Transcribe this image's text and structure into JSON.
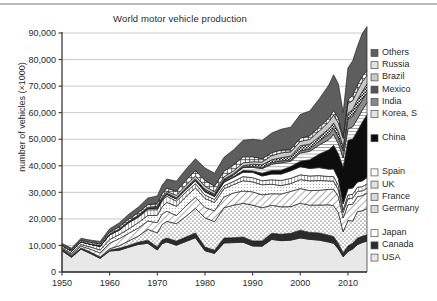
{
  "chart_data": {
    "type": "area",
    "title": "World motor vehicle production",
    "xlabel": "",
    "ylabel": "number of vehicles (×1000)",
    "xlim": [
      1950,
      2014
    ],
    "ylim": [
      0,
      90000
    ],
    "xticks": [
      "1950",
      "1960",
      "1970",
      "1980",
      "1990",
      "2000",
      "2010"
    ],
    "xtick_values": [
      1950,
      1960,
      1970,
      1980,
      1990,
      2000,
      2010
    ],
    "yticks": [
      "0",
      "10,000",
      "20,000",
      "30,000",
      "40,000",
      "50,000",
      "60,000",
      "70,000",
      "80,000",
      "90,000"
    ],
    "ytick_values": [
      0,
      10000,
      20000,
      30000,
      40000,
      50000,
      60000,
      70000,
      80000,
      90000
    ],
    "grid": true,
    "legend_position": "right",
    "stacked": true,
    "x": [
      1950,
      1952,
      1954,
      1956,
      1958,
      1960,
      1962,
      1964,
      1966,
      1968,
      1970,
      1971,
      1972,
      1974,
      1976,
      1978,
      1980,
      1982,
      1984,
      1986,
      1988,
      1990,
      1992,
      1994,
      1996,
      1998,
      2000,
      2002,
      2004,
      2006,
      2007,
      2008,
      2009,
      2010,
      2011,
      2012,
      2013,
      2014
    ],
    "series": [
      {
        "name": "USA",
        "pattern": "solid-lightest",
        "color": "#e8e8e8",
        "values": [
          8006,
          5539,
          8611,
          6920,
          5126,
          7905,
          8189,
          9308,
          10358,
          10820,
          8284,
          10672,
          11314,
          10071,
          11498,
          12887,
          8010,
          6985,
          10939,
          11063,
          11214,
          9783,
          9729,
          12263,
          11799,
          12003,
          12800,
          12280,
          11990,
          11264,
          10781,
          8694,
          5709,
          7743,
          8662,
          10336,
          11066,
          11660
        ]
      },
      {
        "name": "Canada",
        "pattern": "solid-dark",
        "color": "#2b2b2b",
        "values": [
          390,
          510,
          366,
          472,
          353,
          398,
          708,
          671,
          863,
          1175,
          1160,
          1372,
          1471,
          1560,
          1646,
          1818,
          1374,
          1236,
          1835,
          1854,
          1976,
          1928,
          1961,
          2321,
          2397,
          2568,
          2962,
          2629,
          2712,
          2572,
          2578,
          2082,
          1490,
          2068,
          2135,
          2463,
          2380,
          2394
        ]
      },
      {
        "name": "Japan",
        "pattern": "dots",
        "color": "#ffffff",
        "values": [
          32,
          39,
          70,
          111,
          188,
          482,
          991,
          1702,
          2286,
          4086,
          5289,
          5810,
          6294,
          6552,
          7841,
          9269,
          11043,
          10732,
          11465,
          12260,
          12700,
          13487,
          12499,
          10554,
          10346,
          10050,
          10141,
          10257,
          10512,
          11484,
          11596,
          11576,
          7934,
          9629,
          8399,
          9943,
          9630,
          9775
        ]
      },
      {
        "name": "Germany",
        "pattern": "diagonal",
        "color": "#ffffff",
        "values": [
          306,
          441,
          684,
          1075,
          1495,
          2055,
          2668,
          2911,
          3050,
          3103,
          3842,
          3986,
          3816,
          3097,
          3868,
          4186,
          3879,
          4062,
          4045,
          4598,
          4625,
          4977,
          4864,
          4356,
          4843,
          5727,
          5527,
          5469,
          5570,
          5819,
          6213,
          6046,
          5210,
          5906,
          6311,
          5649,
          5718,
          5908
        ]
      },
      {
        "name": "France",
        "pattern": "fine-dots",
        "color": "#ffffff",
        "values": [
          357,
          500,
          601,
          827,
          1128,
          1369,
          1536,
          1616,
          2025,
          2076,
          2750,
          2694,
          3329,
          3475,
          3487,
          3508,
          3378,
          3149,
          3062,
          3120,
          3868,
          3769,
          3768,
          3555,
          3148,
          2954,
          3348,
          3702,
          3666,
          3169,
          3019,
          2569,
          2048,
          2229,
          2294,
          1968,
          1740,
          1821
        ]
      },
      {
        "name": "UK",
        "pattern": "vertical",
        "color": "#ffffff",
        "values": [
          784,
          900,
          1037,
          1005,
          1364,
          1811,
          1675,
          2332,
          2046,
          2183,
          2098,
          2198,
          2329,
          1937,
          1775,
          1608,
          1313,
          1156,
          1134,
          1249,
          1545,
          1566,
          1536,
          1694,
          1924,
          1977,
          1814,
          1823,
          1856,
          1650,
          1750,
          1650,
          1090,
          1393,
          1464,
          1577,
          1598,
          1598
        ]
      },
      {
        "name": "Spain",
        "pattern": "empty",
        "color": "#ffffff",
        "values": [
          2,
          5,
          10,
          20,
          35,
          50,
          85,
          180,
          280,
          400,
          530,
          560,
          660,
          790,
          940,
          1090,
          1182,
          1070,
          1310,
          1480,
          1650,
          2053,
          1796,
          2142,
          2412,
          2826,
          3033,
          2855,
          3012,
          2778,
          2890,
          2542,
          2170,
          2388,
          2353,
          1979,
          2163,
          2403
        ]
      },
      {
        "name": "China",
        "pattern": "solid-black",
        "color": "#0d0d0d",
        "values": [
          0,
          3,
          5,
          8,
          12,
          22,
          30,
          28,
          55,
          25,
          87,
          111,
          108,
          105,
          135,
          149,
          222,
          196,
          317,
          370,
          647,
          509,
          1062,
          1353,
          1475,
          1628,
          2069,
          3287,
          5071,
          7278,
          8882,
          9345,
          13791,
          18265,
          18419,
          19272,
          22117,
          23723
        ]
      },
      {
        "name": "Korea, S",
        "pattern": "horizontal",
        "color": "#ffffff",
        "values": [
          0,
          0,
          0,
          0,
          0,
          0,
          2,
          3,
          9,
          22,
          29,
          34,
          23,
          31,
          49,
          87,
          123,
          163,
          265,
          602,
          1083,
          1322,
          1730,
          2312,
          2813,
          1954,
          3115,
          3148,
          3469,
          3840,
          4086,
          3827,
          3513,
          4272,
          4657,
          4562,
          4521,
          4525
        ]
      },
      {
        "name": "India",
        "pattern": "solid-mid",
        "color": "#8a8a8a",
        "values": [
          17,
          23,
          28,
          34,
          43,
          55,
          66,
          74,
          88,
          78,
          80,
          85,
          90,
          95,
          105,
          110,
          113,
          125,
          157,
          185,
          228,
          364,
          340,
          600,
          690,
          520,
          801,
          895,
          1511,
          2019,
          2254,
          2332,
          2632,
          3557,
          3936,
          4175,
          3881,
          3844
        ]
      },
      {
        "name": "Mexico",
        "pattern": "checker",
        "color": "#ffffff",
        "values": [
          20,
          28,
          35,
          45,
          55,
          63,
          70,
          85,
          108,
          130,
          190,
          200,
          230,
          285,
          325,
          385,
          490,
          473,
          458,
          260,
          513,
          821,
          1083,
          1097,
          1220,
          1460,
          1923,
          1805,
          1578,
          2046,
          2095,
          2191,
          1561,
          2342,
          2557,
          3002,
          3055,
          3220
        ]
      },
      {
        "name": "Brazil",
        "pattern": "solid-light",
        "color": "#c9c9c9",
        "values": [
          0,
          10,
          25,
          40,
          60,
          133,
          191,
          184,
          225,
          280,
          416,
          517,
          622,
          906,
          986,
          1064,
          1165,
          859,
          865,
          1056,
          1069,
          914,
          1074,
          1581,
          1804,
          1586,
          1682,
          1792,
          2210,
          2611,
          2977,
          3216,
          3183,
          3648,
          3406,
          3343,
          3713,
          3146
        ]
      },
      {
        "name": "Russia",
        "pattern": "plus-grid",
        "color": "#ffffff",
        "values": [
          400,
          470,
          530,
          590,
          660,
          720,
          780,
          850,
          920,
          1010,
          1100,
          1200,
          1290,
          1500,
          1900,
          2100,
          2200,
          2100,
          2150,
          2200,
          2250,
          1900,
          1200,
          1100,
          1100,
          1000,
          1200,
          1400,
          1500,
          1500,
          1660,
          1790,
          725,
          1404,
          1990,
          2232,
          2184,
          1887
        ]
      },
      {
        "name": "Others",
        "pattern": "solid-darkgray",
        "color": "#5e5e5e",
        "values": [
          400,
          520,
          700,
          850,
          1000,
          1200,
          1500,
          1800,
          2100,
          2450,
          2800,
          3200,
          3400,
          3800,
          4100,
          4400,
          4700,
          4900,
          5200,
          5700,
          6200,
          6600,
          6900,
          7400,
          7800,
          8300,
          8900,
          9300,
          10600,
          12400,
          13500,
          12900,
          9000,
          12000,
          13000,
          14500,
          16000,
          16500
        ]
      }
    ]
  },
  "legend": {
    "groups": [
      {
        "items": [
          {
            "label": "Others",
            "pattern": "solid-darkgray"
          },
          {
            "label": "Russia",
            "pattern": "plus-grid"
          },
          {
            "label": "Brazil",
            "pattern": "solid-light"
          },
          {
            "label": "Mexico",
            "pattern": "checker"
          },
          {
            "label": "India",
            "pattern": "solid-mid"
          },
          {
            "label": "Korea, S",
            "pattern": "horizontal"
          }
        ]
      },
      {
        "items": [
          {
            "label": "China",
            "pattern": "solid-black"
          }
        ]
      },
      {
        "items": [
          {
            "label": "Spain",
            "pattern": "empty"
          },
          {
            "label": "UK",
            "pattern": "vertical"
          },
          {
            "label": "France",
            "pattern": "fine-dots"
          },
          {
            "label": "Germany",
            "pattern": "diagonal"
          }
        ]
      },
      {
        "items": [
          {
            "label": "Japan",
            "pattern": "dots"
          },
          {
            "label": "Canada",
            "pattern": "solid-dark"
          },
          {
            "label": "USA",
            "pattern": "solid-lightest"
          }
        ]
      }
    ]
  },
  "colors": {
    "axis": "#3a3a3a",
    "grid": "#c4c4c4",
    "text": "#2a2a2a",
    "rule": "#b9b9b9"
  }
}
